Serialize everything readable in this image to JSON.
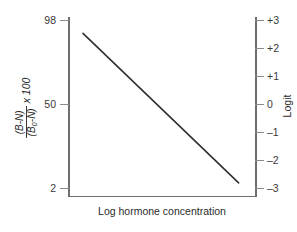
{
  "chart_data": {
    "type": "line",
    "title": "",
    "subtitle": "",
    "xlabel": "Log hormone concentration",
    "ylabel_left_numerator": "(B-N)",
    "ylabel_left_denominator": "(B",
    "ylabel_left_denominator_sub": "0",
    "ylabel_left_denominator_tail": "-N)",
    "ylabel_left_multiplier": "x 100",
    "ylabel_right": "Logit",
    "grid": false,
    "legend": "none",
    "x": [
      0,
      1
    ],
    "series": [
      {
        "name": "standard curve",
        "color": "#2f2f2f",
        "x": [
          0.08,
          0.91
        ],
        "logit": [
          2.54,
          -2.8
        ],
        "percent_bound": [
          92.7,
          5.7
        ]
      }
    ],
    "left_axis": {
      "name": "percent-bound",
      "scale": "logit",
      "tick_labels": [
        "98",
        "50",
        "2"
      ],
      "tick_values": [
        98,
        50,
        2
      ],
      "tick_logits": [
        3.0,
        0.0,
        -3.0
      ]
    },
    "right_axis": {
      "name": "logit",
      "scale": "linear",
      "tick_labels": [
        "+3",
        "+2",
        "+1",
        "0",
        "–1",
        "–2",
        "–3"
      ],
      "tick_values": [
        3,
        2,
        1,
        0,
        -1,
        -2,
        -3
      ],
      "ylim": [
        -3,
        3
      ]
    },
    "annotations": []
  },
  "figure": {
    "line_color": "#2f2f2f",
    "axis_color": "#6e6e6e",
    "text_color": "#2b2b2b",
    "background": "#ffffff"
  }
}
